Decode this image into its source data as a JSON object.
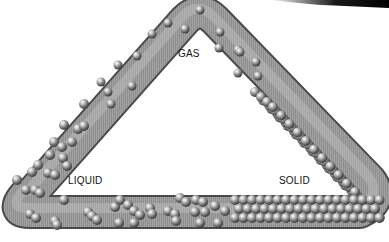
{
  "labels": {
    "gas": "GAS",
    "liquid": "LIQUID",
    "solid": "SOLID"
  },
  "colors": {
    "tube": "#8c8c8c",
    "tube_highlight": "#c8c8c8",
    "tube_shadow": "#555555",
    "sphere": "#9a9a9a",
    "background": "#ffffff"
  }
}
